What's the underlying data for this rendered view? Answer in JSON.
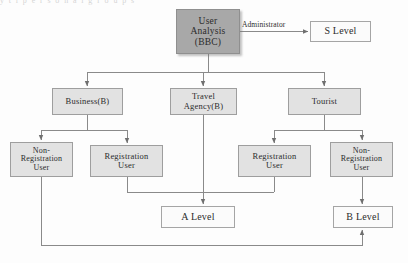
{
  "diagram": {
    "type": "flowchart",
    "title_strip": "y t   i     p     e     r    s    o    n    a    l         g    r    o    u    p     s",
    "colors": {
      "root_fill": "#a8a8a8",
      "node_fill": "#e2e2e2",
      "leaf_fill": "#fbfbfb",
      "border": "#9e9e9e",
      "line": "#8a8a8a",
      "text": "#2b2b2b"
    },
    "nodes": [
      {
        "id": "user-analysis",
        "label": "User\nAnalysis\n(BBC)",
        "style": "dark",
        "x": 176,
        "y": 9,
        "w": 64,
        "h": 45,
        "font_size": 9.5
      },
      {
        "id": "s-level",
        "label": "S Level",
        "style": "light",
        "x": 310,
        "y": 21,
        "w": 61,
        "h": 21,
        "font_size": 10
      },
      {
        "id": "business-b",
        "label": "Business(B)",
        "style": "gray",
        "x": 52,
        "y": 88,
        "w": 71,
        "h": 27,
        "font_size": 8.5
      },
      {
        "id": "travel-agency-b",
        "label": "Travel\nAgency(B)",
        "style": "gray",
        "x": 170,
        "y": 88,
        "w": 67,
        "h": 27,
        "font_size": 8.5
      },
      {
        "id": "tourist",
        "label": "Tourist",
        "style": "gray",
        "x": 288,
        "y": 88,
        "w": 73,
        "h": 27,
        "font_size": 8.5
      },
      {
        "id": "non-registration-user-left",
        "label": "Non-\nRegistration\nUser",
        "style": "gray",
        "x": 10,
        "y": 142,
        "w": 63,
        "h": 35,
        "font_size": 8
      },
      {
        "id": "registration-user-left",
        "label": "Registration\nUser",
        "style": "gray",
        "x": 90,
        "y": 145,
        "w": 73,
        "h": 32,
        "font_size": 8.5
      },
      {
        "id": "registration-user-right",
        "label": "Registration\nUser",
        "style": "gray",
        "x": 238,
        "y": 145,
        "w": 73,
        "h": 32,
        "font_size": 8.5
      },
      {
        "id": "non-registration-user-right",
        "label": "Non-\nRegistration\nUser",
        "style": "gray",
        "x": 330,
        "y": 142,
        "w": 63,
        "h": 35,
        "font_size": 8
      },
      {
        "id": "a-level",
        "label": "A Level",
        "style": "light",
        "x": 161,
        "y": 206,
        "w": 74,
        "h": 22,
        "font_size": 10
      },
      {
        "id": "b-level",
        "label": "B Level",
        "style": "light",
        "x": 333,
        "y": 206,
        "w": 60,
        "h": 22,
        "font_size": 10
      }
    ],
    "edge_labels": [
      {
        "id": "administrator",
        "text": "Administrator",
        "x": 242,
        "y": 20
      }
    ],
    "edges": [
      {
        "from": "user-analysis",
        "to": "s-level",
        "label": "Administrator"
      },
      {
        "from": "user-analysis",
        "to": "business-b",
        "label": ""
      },
      {
        "from": "user-analysis",
        "to": "travel-agency-b",
        "label": ""
      },
      {
        "from": "user-analysis",
        "to": "tourist",
        "label": ""
      },
      {
        "from": "business-b",
        "to": "non-registration-user-left",
        "label": ""
      },
      {
        "from": "business-b",
        "to": "registration-user-left",
        "label": ""
      },
      {
        "from": "tourist",
        "to": "registration-user-right",
        "label": ""
      },
      {
        "from": "tourist",
        "to": "non-registration-user-right",
        "label": ""
      },
      {
        "from": "travel-agency-b",
        "to": "a-level",
        "label": ""
      },
      {
        "from": "registration-user-left",
        "to": "a-level",
        "label": ""
      },
      {
        "from": "registration-user-right",
        "to": "a-level",
        "label": ""
      },
      {
        "from": "non-registration-user-right",
        "to": "b-level",
        "label": ""
      },
      {
        "from": "non-registration-user-left",
        "to": "b-level",
        "label": ""
      }
    ]
  }
}
